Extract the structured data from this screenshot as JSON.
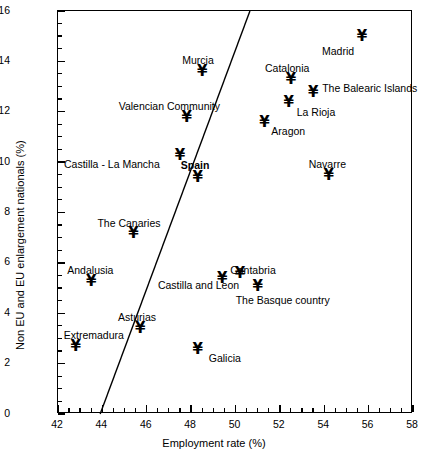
{
  "chart_data": {
    "type": "scatter",
    "title": "",
    "xlabel": "Employment rate (%)",
    "ylabel": "Non EU and EU enlargement nationals (%)",
    "xlim": [
      42,
      58
    ],
    "ylim": [
      0,
      16
    ],
    "xticks": [
      42,
      44,
      46,
      48,
      50,
      52,
      54,
      56,
      58
    ],
    "yticks": [
      0,
      2,
      4,
      6,
      8,
      10,
      12,
      14,
      16
    ],
    "xtick_labels": [
      "42",
      "44",
      "46",
      "48",
      "50",
      "52",
      "54",
      "56",
      "58"
    ],
    "ytick_labels": [
      "0",
      "2",
      "4",
      "6",
      "8",
      "10",
      "12",
      "14",
      "16"
    ],
    "x_minor_step": 0.5,
    "y_minor_step": 0.5,
    "grid": false,
    "legend": false,
    "marker": "yen-glyph",
    "marker_symbol": "¥",
    "points": [
      {
        "label": "Madrid",
        "x": 55.7,
        "y": 15.0,
        "lx": -40,
        "ly": 10,
        "bold": false
      },
      {
        "label": "Murcia",
        "x": 48.5,
        "y": 13.6,
        "lx": -20,
        "ly": -16,
        "bold": false
      },
      {
        "label": "Catalonia",
        "x": 52.5,
        "y": 13.3,
        "lx": -26,
        "ly": -16,
        "bold": false
      },
      {
        "label": "The Balearic Islands",
        "x": 53.5,
        "y": 12.8,
        "lx": 9,
        "ly": -9,
        "bold": false
      },
      {
        "label": "La Rioja",
        "x": 52.4,
        "y": 12.4,
        "lx": 8,
        "ly": 5,
        "bold": false
      },
      {
        "label": "Valencian Community",
        "x": 47.8,
        "y": 11.8,
        "lx": -68,
        "ly": -16,
        "bold": false
      },
      {
        "label": "Aragon",
        "x": 51.3,
        "y": 11.6,
        "lx": 7,
        "ly": 4,
        "bold": false
      },
      {
        "label": "Castilla - La Mancha",
        "x": 47.5,
        "y": 10.3,
        "lx": -116,
        "ly": 4,
        "bold": false
      },
      {
        "label": "Navarre",
        "x": 54.2,
        "y": 9.5,
        "lx": -20,
        "ly": -16,
        "bold": false
      },
      {
        "label": "Spain",
        "x": 48.3,
        "y": 9.4,
        "lx": -17,
        "ly": -17,
        "bold": true
      },
      {
        "label": "The Canaries",
        "x": 45.4,
        "y": 7.2,
        "lx": -36,
        "ly": -15,
        "bold": false
      },
      {
        "label": "Castilla and Leon",
        "x": 50.2,
        "y": 5.6,
        "lx": -82,
        "ly": 7,
        "bold": false
      },
      {
        "label": "Cantabria",
        "x": 49.4,
        "y": 5.4,
        "lx": 8,
        "ly": -13,
        "bold": false
      },
      {
        "label": "Andalusia",
        "x": 43.5,
        "y": 5.3,
        "lx": -24,
        "ly": -16,
        "bold": false
      },
      {
        "label": "The Basque country",
        "x": 51.0,
        "y": 5.1,
        "lx": -22,
        "ly": 9,
        "bold": false
      },
      {
        "label": "Asturias",
        "x": 45.7,
        "y": 3.4,
        "lx": -22,
        "ly": -16,
        "bold": false
      },
      {
        "label": "Extremadura",
        "x": 42.8,
        "y": 2.7,
        "lx": -12,
        "ly": -16,
        "bold": false
      },
      {
        "label": "Galicia",
        "x": 48.3,
        "y": 2.6,
        "lx": 11,
        "ly": 4,
        "bold": false
      }
    ],
    "fit_line": {
      "x0": 43.9,
      "y0": 0.0,
      "x1": 50.65,
      "y1": 16.0
    }
  }
}
